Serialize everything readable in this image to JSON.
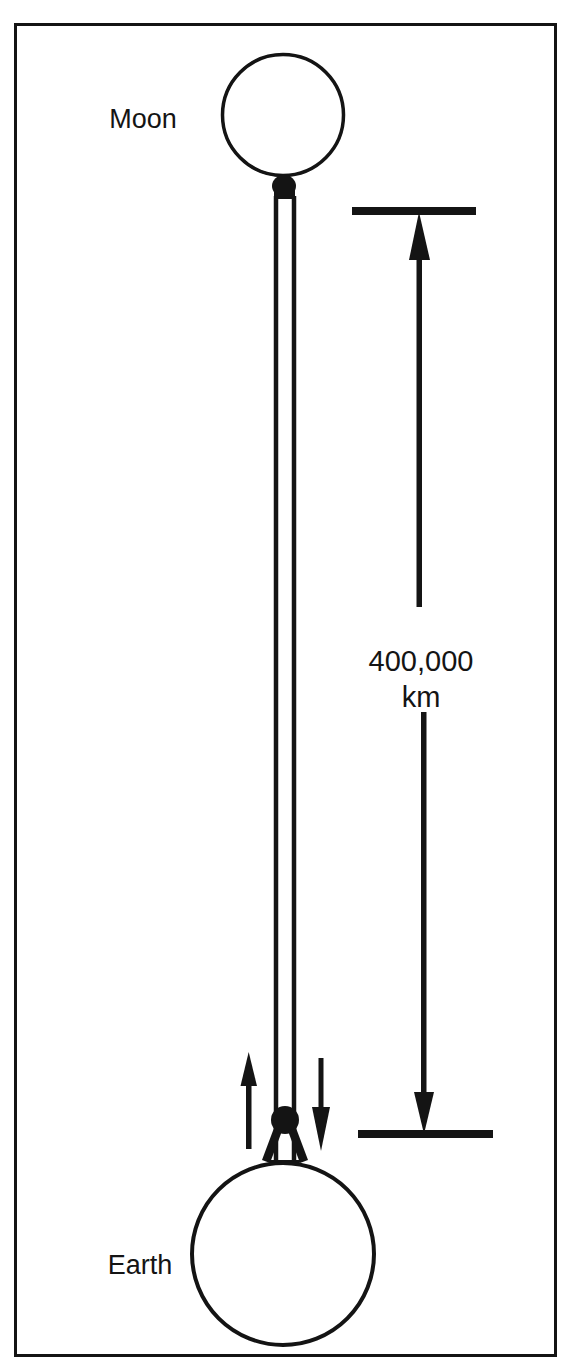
{
  "figure": {
    "background_color": "#ffffff",
    "ink_color": "#141414",
    "border": {
      "present": true,
      "x": 14,
      "y": 23,
      "width": 542,
      "height": 1333,
      "stroke_width": 3
    }
  },
  "labels": {
    "moon": "Moon",
    "earth": "Earth",
    "distance_value": "400,000",
    "distance_unit": "km"
  },
  "bodies": [
    {
      "name": "Moon",
      "label": "Moon",
      "center_x": 283,
      "center_y": 115,
      "radius": 61,
      "shading": "crescent",
      "lit_side": "right",
      "label_x": 143,
      "label_y": 128
    },
    {
      "name": "Earth",
      "label": "Earth",
      "center_x": 283,
      "center_y": 1254,
      "radius": 92,
      "shading": "crescent",
      "lit_side": "right",
      "label_x": 140,
      "label_y": 1274
    }
  ],
  "tether": {
    "name": "connecting-band",
    "description": "narrow two-line band joining Moon to Earth",
    "left_x": 275,
    "right_x": 294,
    "top_y": 198,
    "bottom_y": 1160
  },
  "measurement": {
    "name": "distance-dimension",
    "value": "400,000",
    "unit": "km",
    "top_tick_y": 212,
    "bottom_tick_y": 1134,
    "top_tick_x1": 352,
    "top_tick_x2": 476,
    "bottom_tick_x1": 358,
    "bottom_tick_x2": 493,
    "axis_x": 422,
    "text_x": 422,
    "text_value_y": 662,
    "text_unit_y": 697
  },
  "motion_arrows": [
    {
      "name": "up-arrow",
      "direction": "up",
      "x": 249,
      "top_y": 1052,
      "bottom_y": 1148
    },
    {
      "name": "down-arrow",
      "direction": "down",
      "x": 321,
      "top_y": 1058,
      "bottom_y": 1150
    }
  ],
  "text_styles": {
    "body_font_size": "27px",
    "distance_font_size": "29px"
  }
}
